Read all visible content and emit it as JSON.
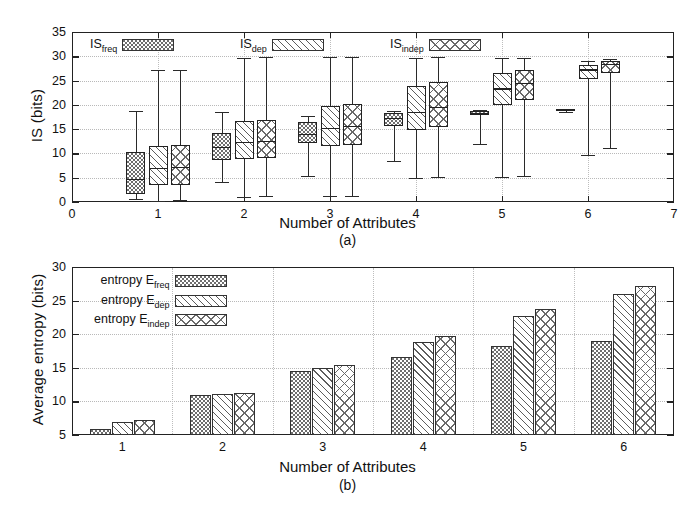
{
  "figure": {
    "panel_a_caption": "(a)",
    "panel_b_caption": "(b)"
  },
  "panel_a": {
    "ylabel": "IS (bits)",
    "xlabel": "Number of Attributes",
    "yticks": [
      "0",
      "5",
      "10",
      "15",
      "20",
      "25",
      "30",
      "35"
    ],
    "xticks": [
      "0",
      "1",
      "2",
      "3",
      "4",
      "5",
      "6",
      "7"
    ],
    "legend": [
      {
        "label": "IS",
        "sub": "freq",
        "pattern": "hatch-dots"
      },
      {
        "label": "IS",
        "sub": "dep",
        "pattern": "hatch-diag"
      },
      {
        "label": "IS",
        "sub": "indep",
        "pattern": "hatch-cross"
      }
    ]
  },
  "panel_b": {
    "ylabel": "Average entropy (bits)",
    "xlabel": "Number of Attributes",
    "yticks": [
      "5",
      "10",
      "15",
      "20",
      "25",
      "30"
    ],
    "xticks": [
      "1",
      "2",
      "3",
      "4",
      "5",
      "6"
    ],
    "legend": [
      {
        "label": "entropy E",
        "sub": "freq",
        "pattern": "hatch-dots"
      },
      {
        "label": "entropy E",
        "sub": "dep",
        "pattern": "hatch-diag"
      },
      {
        "label": "entropy E",
        "sub": "indep",
        "pattern": "hatch-cross"
      }
    ]
  },
  "chart_data": [
    {
      "type": "box",
      "title": "",
      "xlabel": "Number of Attributes",
      "ylabel": "IS (bits)",
      "xlim": [
        0,
        7
      ],
      "ylim": [
        0,
        35
      ],
      "grid": true,
      "legend_position": "top-inside",
      "categories": [
        1,
        2,
        3,
        4,
        5,
        6
      ],
      "series": [
        {
          "name": "IS_freq",
          "pattern": "dots",
          "boxes": [
            {
              "x": 1,
              "whisker_low": 0.6,
              "q1": 1.7,
              "median": 4.8,
              "q3": 10.3,
              "whisker_high": 18.7
            },
            {
              "x": 2,
              "whisker_low": 4.2,
              "q1": 8.6,
              "median": 11.4,
              "q3": 14.2,
              "whisker_high": 18.5
            },
            {
              "x": 3,
              "whisker_low": 5.4,
              "q1": 12.2,
              "median": 14.0,
              "q3": 16.4,
              "whisker_high": 17.7
            },
            {
              "x": 4,
              "whisker_low": 8.4,
              "q1": 15.6,
              "median": 17.3,
              "q3": 18.4,
              "whisker_high": 18.7
            },
            {
              "x": 5,
              "whisker_low": 11.9,
              "q1": 18.0,
              "median": 18.3,
              "q3": 18.7,
              "whisker_high": 18.9
            },
            {
              "x": 6,
              "whisker_low": 18.6,
              "q1": 18.7,
              "median": 18.9,
              "q3": 19.1,
              "whisker_high": 19.2
            }
          ]
        },
        {
          "name": "IS_dep",
          "pattern": "diagonal",
          "boxes": [
            {
              "x": 1,
              "whisker_low": 0.3,
              "q1": 3.4,
              "median": 7.0,
              "q3": 11.6,
              "whisker_high": 27.1
            },
            {
              "x": 2,
              "whisker_low": 1.1,
              "q1": 8.9,
              "median": 12.3,
              "q3": 16.6,
              "whisker_high": 29.6
            },
            {
              "x": 3,
              "whisker_low": 1.2,
              "q1": 11.6,
              "median": 15.2,
              "q3": 19.8,
              "whisker_high": 29.8
            },
            {
              "x": 4,
              "whisker_low": 4.9,
              "q1": 14.9,
              "median": 18.5,
              "q3": 23.8,
              "whisker_high": 29.7
            },
            {
              "x": 5,
              "whisker_low": 5.1,
              "q1": 20.0,
              "median": 23.4,
              "q3": 26.6,
              "whisker_high": 29.6
            },
            {
              "x": 6,
              "whisker_low": 9.6,
              "q1": 25.4,
              "median": 27.3,
              "q3": 28.3,
              "whisker_high": 29.0
            }
          ]
        },
        {
          "name": "IS_indep",
          "pattern": "crosshatch",
          "boxes": [
            {
              "x": 1,
              "whisker_low": 0.4,
              "q1": 3.4,
              "median": 7.2,
              "q3": 11.8,
              "whisker_high": 27.1
            },
            {
              "x": 2,
              "whisker_low": 1.2,
              "q1": 9.1,
              "median": 12.6,
              "q3": 16.9,
              "whisker_high": 29.8
            },
            {
              "x": 3,
              "whisker_low": 1.3,
              "q1": 11.8,
              "median": 15.6,
              "q3": 20.1,
              "whisker_high": 29.9
            },
            {
              "x": 4,
              "whisker_low": 5.1,
              "q1": 15.4,
              "median": 19.6,
              "q3": 24.7,
              "whisker_high": 29.8
            },
            {
              "x": 5,
              "whisker_low": 5.4,
              "q1": 21.0,
              "median": 24.6,
              "q3": 27.2,
              "whisker_high": 29.6
            },
            {
              "x": 6,
              "whisker_low": 11.1,
              "q1": 26.6,
              "median": 28.4,
              "q3": 29.1,
              "whisker_high": 29.4
            }
          ]
        }
      ]
    },
    {
      "type": "bar",
      "title": "",
      "xlabel": "Number of Attributes",
      "ylabel": "Average entropy (bits)",
      "categories": [
        "1",
        "2",
        "3",
        "4",
        "5",
        "6"
      ],
      "ylim": [
        5,
        30
      ],
      "grid": true,
      "legend_position": "top-left-inside",
      "series": [
        {
          "name": "entropy E_freq",
          "pattern": "dots",
          "values": [
            5.9,
            11.0,
            14.5,
            16.6,
            18.2,
            19.0
          ]
        },
        {
          "name": "entropy E_dep",
          "pattern": "diagonal",
          "values": [
            7.0,
            11.1,
            14.9,
            18.8,
            22.7,
            26.0
          ]
        },
        {
          "name": "entropy E_indep",
          "pattern": "crosshatch",
          "values": [
            7.3,
            11.2,
            15.4,
            19.7,
            23.8,
            27.1
          ]
        }
      ]
    }
  ]
}
